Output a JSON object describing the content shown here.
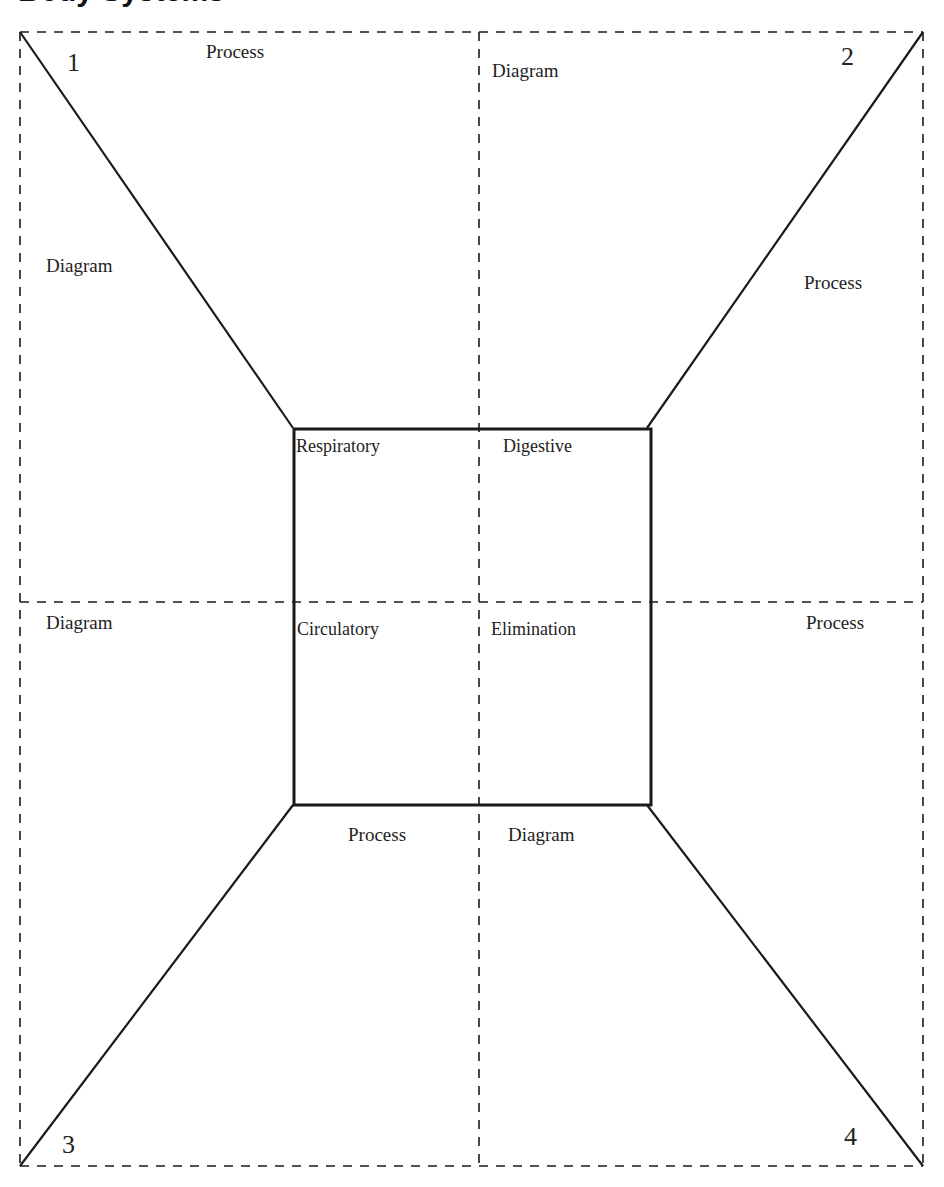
{
  "title": "Body Systems",
  "corners": {
    "top_left": "1",
    "top_right": "2",
    "bottom_left": "3",
    "bottom_right": "4"
  },
  "outer_labels": {
    "top_left_process": "Process",
    "top_right_diagram": "Diagram",
    "left_upper_diagram": "Diagram",
    "right_upper_process": "Process",
    "left_lower_diagram": "Diagram",
    "right_lower_process": "Process",
    "bottom_left_process": "Process",
    "bottom_right_diagram": "Diagram"
  },
  "inner_box": {
    "top_left": "Respiratory",
    "top_right": "Digestive",
    "bottom_left": "Circulatory",
    "bottom_right": "Elimination"
  },
  "colors": {
    "line": "#1a1a1a",
    "background": "#ffffff"
  }
}
